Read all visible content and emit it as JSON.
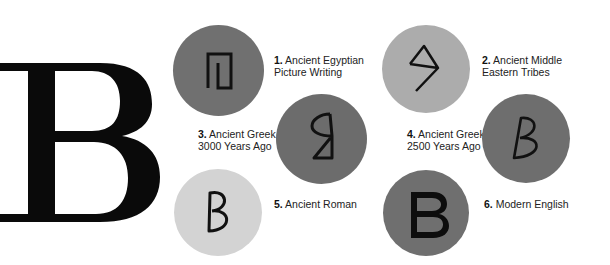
{
  "title_letter": "B",
  "colors": {
    "background": "#ffffff",
    "letter": "#0a0a0a",
    "circle_dark": "#6f6f6f",
    "circle_medium": "#ababab",
    "circle_light": "#d4d4d4",
    "glyph_stroke": "#111111"
  },
  "stages": [
    {
      "number": "1.",
      "line1": "Ancient Egyptian",
      "line2": "Picture Writing",
      "glyph": "egyptian-house-glyph"
    },
    {
      "number": "2.",
      "line1": "Ancient Middle",
      "line2": "Eastern Tribes",
      "glyph": "semitic-beth-glyph"
    },
    {
      "number": "3.",
      "line1": "Ancient Greek",
      "line2": "3000 Years Ago",
      "glyph": "early-greek-beta-glyph"
    },
    {
      "number": "4.",
      "line1": "Ancient Greek",
      "line2": "2500 Years Ago",
      "glyph": "classical-greek-beta-glyph"
    },
    {
      "number": "5.",
      "line1": "Ancient Roman",
      "line2": "",
      "glyph": "roman-b-glyph"
    },
    {
      "number": "6.",
      "line1": "Modern English",
      "line2": "",
      "glyph": "modern-b-glyph"
    }
  ]
}
